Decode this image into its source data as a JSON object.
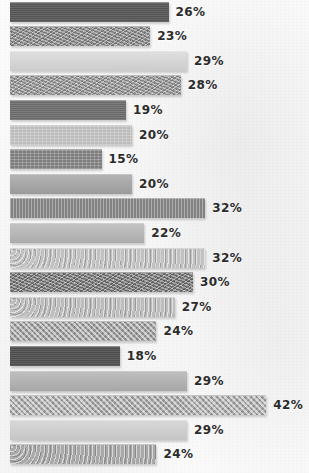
{
  "chart_data": {
    "type": "bar",
    "orientation": "horizontal",
    "title": "",
    "subtitle": "",
    "xlabel": "",
    "ylabel": "",
    "xlim": [
      0,
      45
    ],
    "grid": false,
    "legend": false,
    "value_suffix": "%",
    "categories": [
      "",
      "",
      "",
      "",
      "",
      "",
      "",
      "",
      "",
      "",
      "",
      "",
      "",
      "",
      "",
      "",
      "",
      "",
      ""
    ],
    "values": [
      26,
      23,
      29,
      28,
      19,
      20,
      15,
      20,
      32,
      22,
      32,
      30,
      27,
      24,
      18,
      29,
      42,
      29,
      24
    ],
    "bars": [
      {
        "value": 26,
        "label": "26%",
        "color": "#575757",
        "texture": "tex-solid"
      },
      {
        "value": 23,
        "label": "23%",
        "color": "#8d8d8d",
        "texture": "tex-noise"
      },
      {
        "value": 29,
        "label": "29%",
        "color": "#d7d7d7",
        "texture": "tex-plain"
      },
      {
        "value": 28,
        "label": "28%",
        "color": "#9a9a9a",
        "texture": "tex-noise"
      },
      {
        "value": 19,
        "label": "19%",
        "color": "#6e6e6e",
        "texture": "tex-solid"
      },
      {
        "value": 20,
        "label": "20%",
        "color": "#bcbcbc",
        "texture": "tex-grid"
      },
      {
        "value": 15,
        "label": "15%",
        "color": "#7d7d7d",
        "texture": "tex-grid"
      },
      {
        "value": 20,
        "label": "20%",
        "color": "#a3a3a3",
        "texture": "tex-plain"
      },
      {
        "value": 32,
        "label": "32%",
        "color": "#8a8a8a",
        "texture": "tex-vert"
      },
      {
        "value": 22,
        "label": "22%",
        "color": "#b5b5b5",
        "texture": "tex-plain"
      },
      {
        "value": 32,
        "label": "32%",
        "color": "#c2c2c2",
        "texture": "tex-speckle"
      },
      {
        "value": 30,
        "label": "30%",
        "color": "#787878",
        "texture": "tex-noise"
      },
      {
        "value": 27,
        "label": "27%",
        "color": "#bdbdbd",
        "texture": "tex-speckle"
      },
      {
        "value": 24,
        "label": "24%",
        "color": "#9c9c9c",
        "texture": "tex-weave"
      },
      {
        "value": 18,
        "label": "18%",
        "color": "#4f4f4f",
        "texture": "tex-solid"
      },
      {
        "value": 29,
        "label": "29%",
        "color": "#b0b0b0",
        "texture": "tex-plain"
      },
      {
        "value": 42,
        "label": "42%",
        "color": "#a8a8a8",
        "texture": "tex-weave"
      },
      {
        "value": 29,
        "label": "29%",
        "color": "#cfcfcf",
        "texture": "tex-plain"
      },
      {
        "value": 24,
        "label": "24%",
        "color": "#a9a9a9",
        "texture": "tex-speckle"
      }
    ]
  },
  "style": {
    "background": "#fbfbfb",
    "label_color": "#2b2b2b",
    "origin_x": 10,
    "px_per_unit": 6.1,
    "bar_height": 19,
    "row_pitch": 24.6,
    "top_offset": 2
  }
}
